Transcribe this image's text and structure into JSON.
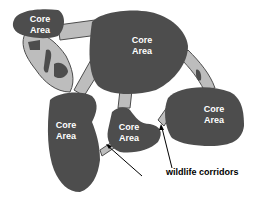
{
  "diagram": {
    "title": "",
    "core_areas": [
      {
        "id": "core-top-left",
        "line1": "Core",
        "line2": "Area"
      },
      {
        "id": "core-top-center",
        "line1": "Core",
        "line2": "Area"
      },
      {
        "id": "core-right",
        "line1": "Core",
        "line2": "Area"
      },
      {
        "id": "core-left",
        "line1": "Core",
        "line2": "Area"
      },
      {
        "id": "core-center-small",
        "line1": "Core",
        "line2": "Area"
      }
    ],
    "callout": {
      "label": "wildlife corridors"
    },
    "colors": {
      "core_fill": "#4d4d4d",
      "corridor_fill": "#bdbdbd",
      "label_text": "#ffffff",
      "callout_text": "#000000",
      "background": "#ffffff"
    }
  }
}
